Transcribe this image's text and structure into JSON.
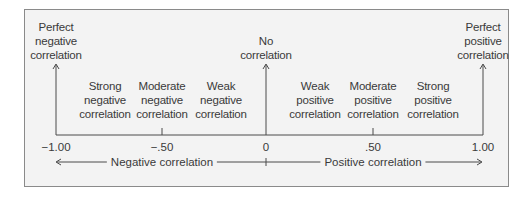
{
  "diagram": {
    "endpoints": [
      {
        "id": "perfect-negative",
        "label": "Perfect\nnegative\ncorrelation",
        "value": "−1.00"
      },
      {
        "id": "no-correlation",
        "label": "No\ncorrelation",
        "value": "0"
      },
      {
        "id": "perfect-positive",
        "label": "Perfect\npositive\ncorrelation",
        "value": "1.00"
      }
    ],
    "categories": [
      {
        "id": "strong-negative",
        "label": "Strong\nnegative\ncorrelation"
      },
      {
        "id": "moderate-negative",
        "label": "Moderate\nnegative\ncorrelation"
      },
      {
        "id": "weak-negative",
        "label": "Weak\nnegative\ncorrelation"
      },
      {
        "id": "weak-positive",
        "label": "Weak\npositive\ncorrelation"
      },
      {
        "id": "moderate-positive",
        "label": "Moderate\npositive\ncorrelation"
      },
      {
        "id": "strong-positive",
        "label": "Strong\npositive\ncorrelation"
      }
    ],
    "ticks": [
      "−1.00",
      "−.50",
      "0",
      ".50",
      "1.00"
    ],
    "ranges": {
      "negative": "Negative correlation",
      "positive": "Positive correlation"
    },
    "colors": {
      "background": "#f3f3f3",
      "line": "#4a4a4a",
      "text": "#3a3a3a",
      "border": "#8a8a8a"
    }
  }
}
